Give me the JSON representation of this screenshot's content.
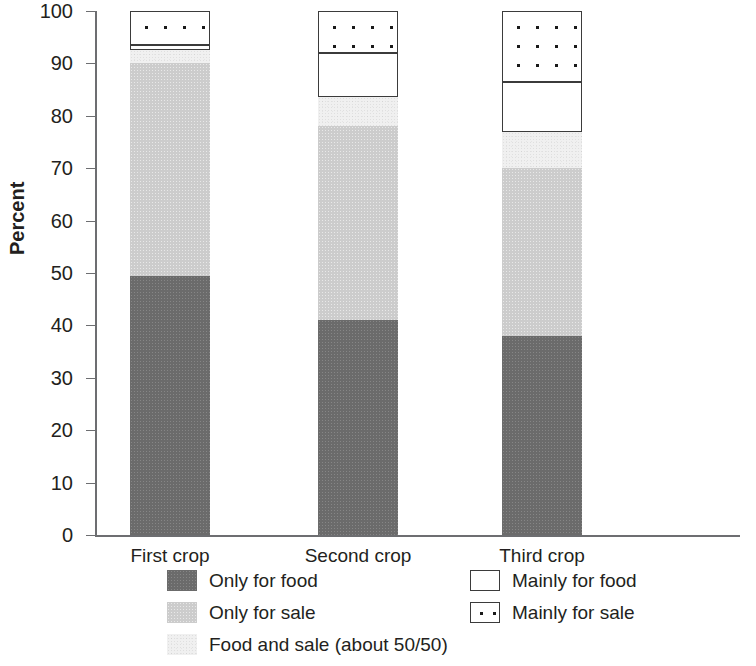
{
  "chart_data": {
    "type": "bar",
    "subtype": "stacked-bar-100",
    "title": "",
    "xlabel": "",
    "ylabel": "Percent",
    "ylim": [
      0,
      100
    ],
    "yticks": [
      0,
      10,
      20,
      30,
      40,
      50,
      60,
      70,
      80,
      90,
      100
    ],
    "ytick_labels": [
      "0",
      "10",
      "20",
      "30",
      "40",
      "50",
      "60",
      "70",
      "80",
      "90",
      "100"
    ],
    "grid": false,
    "legend_position": "bottom",
    "categories": [
      "First crop",
      "Second crop",
      "Third crop"
    ],
    "series": [
      {
        "name": "Only for food",
        "key": "only_for_food",
        "color": "#6b6b6b",
        "pattern": "solid-dark-gray-noise",
        "values": [
          49.5,
          41.0,
          38.0
        ]
      },
      {
        "name": "Only for sale",
        "key": "only_for_sale",
        "color": "#cccccc",
        "pattern": "light-gray-noise",
        "values": [
          40.5,
          37.0,
          32.0
        ]
      },
      {
        "name": "Food and sale (about 50/50)",
        "key": "food_and_sale",
        "color": "#f0f0f0",
        "pattern": "very-light-noise",
        "values": [
          2.5,
          5.5,
          7.0
        ]
      },
      {
        "name": "Mainly for food",
        "key": "mainly_for_food",
        "color": "#ffffff",
        "pattern": "white-outline",
        "values": [
          1.0,
          8.5,
          9.5
        ]
      },
      {
        "name": "Mainly for sale",
        "key": "mainly_for_sale",
        "color": "#ffffff",
        "pattern": "dotted-outline",
        "values": [
          6.5,
          8.0,
          13.5
        ]
      }
    ],
    "cumulative_tops": {
      "First crop": {
        "only_for_food": 49.5,
        "only_for_sale": 90.0,
        "food_and_sale": 92.5,
        "mainly_for_food": 93.5,
        "mainly_for_sale": 100
      },
      "Second crop": {
        "only_for_food": 41.0,
        "only_for_sale": 78.0,
        "food_and_sale": 83.5,
        "mainly_for_food": 92.0,
        "mainly_for_sale": 100
      },
      "Third crop": {
        "only_for_food": 38.0,
        "only_for_sale": 70.0,
        "food_and_sale": 77.0,
        "mainly_for_food": 86.5,
        "mainly_for_sale": 100
      }
    }
  },
  "axis": {
    "y_title": "Percent",
    "y_ticks": [
      "100",
      "90",
      "80",
      "70",
      "60",
      "50",
      "40",
      "30",
      "20",
      "10",
      "0"
    ]
  },
  "categories": {
    "c0": "First crop",
    "c1": "Second crop",
    "c2": "Third crop"
  },
  "legend": {
    "items": [
      {
        "label": "Only for food"
      },
      {
        "label": "Only for sale"
      },
      {
        "label": "Food and sale (about 50/50)"
      },
      {
        "label": "Mainly for food"
      },
      {
        "label": "Mainly for sale"
      }
    ]
  }
}
